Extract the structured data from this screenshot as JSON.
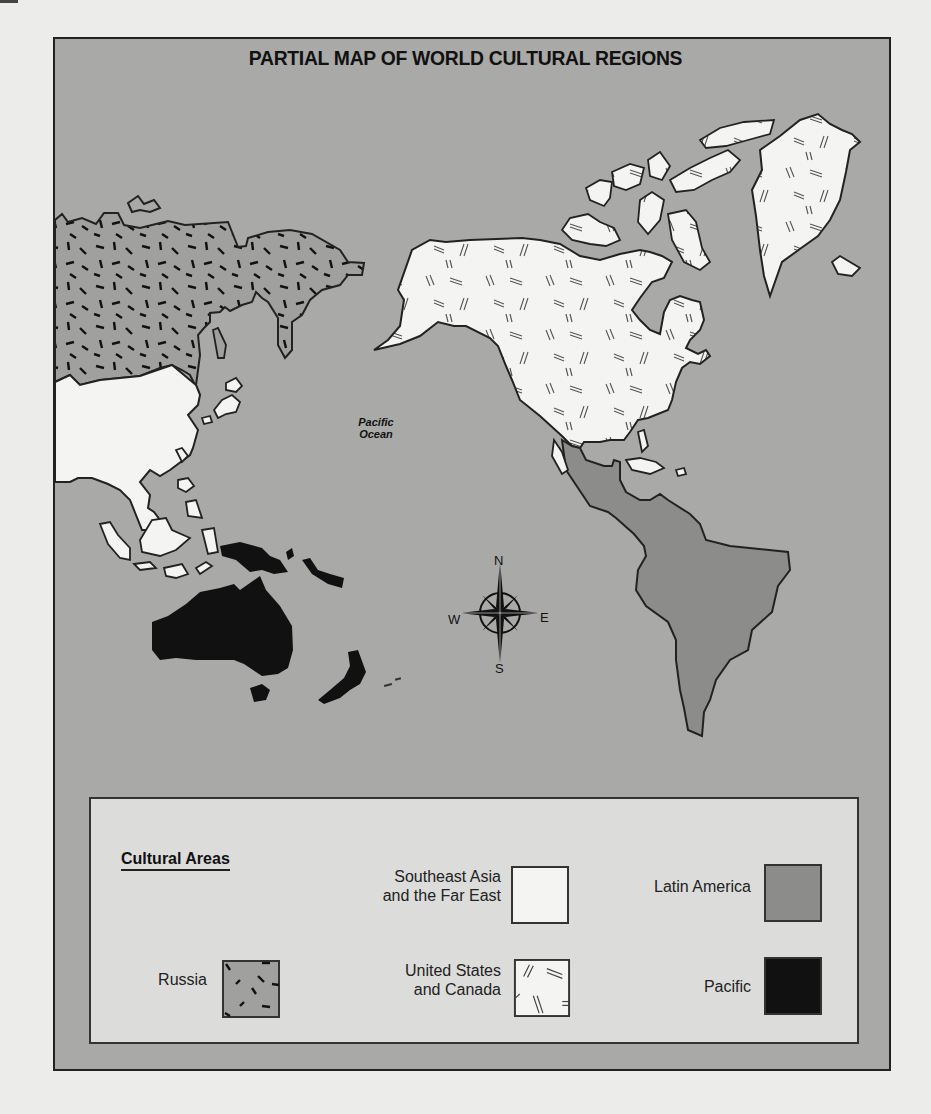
{
  "title": "PARTIAL MAP OF WORLD CULTURAL REGIONS",
  "ocean_label": {
    "line1": "Pacific",
    "line2": "Ocean"
  },
  "compass": {
    "north": "N",
    "south": "S",
    "east": "E",
    "west": "W"
  },
  "legend": {
    "title": "Cultural Areas",
    "items": [
      {
        "label_line1": "Southeast Asia",
        "label_line2": "and the Far East",
        "fill": "#f4f4f2",
        "pattern": "none"
      },
      {
        "label_line1": "Latin America",
        "label_line2": "",
        "fill": "#8c8c8a",
        "pattern": "none"
      },
      {
        "label_line1": "Russia",
        "label_line2": "",
        "fill": "#a0a09e",
        "pattern": "short-dashes"
      },
      {
        "label_line1": "United States",
        "label_line2": "and Canada",
        "fill": "#f4f4f2",
        "pattern": "double-lines"
      },
      {
        "label_line1": "Pacific",
        "label_line2": "",
        "fill": "#111111",
        "pattern": "none"
      }
    ]
  },
  "colors": {
    "ocean": "#a9a9a7",
    "legend_bg": "#dcdcda",
    "southeast_asia": "#f4f4f2",
    "us_canada": "#f4f4f2",
    "latin_america": "#8c8c8a",
    "russia": "#a0a09e",
    "pacific": "#111111",
    "outline": "#222222"
  }
}
